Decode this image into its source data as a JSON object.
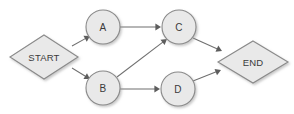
{
  "diagram": {
    "background_color": "#ffffff",
    "node_fill_color": "#e9e9e9",
    "node_stroke_color": "#8a8a8a",
    "edge_color": "#6f6f6f",
    "label_color": "#3a3a3a",
    "nodes": [
      {
        "id": "start",
        "label": "START",
        "shape": "diamond",
        "cx": 44,
        "cy": 57,
        "rx": 34,
        "ry": 22
      },
      {
        "id": "a",
        "label": "A",
        "shape": "circle",
        "cx": 103,
        "cy": 27,
        "r": 17
      },
      {
        "id": "b",
        "label": "B",
        "shape": "circle",
        "cx": 103,
        "cy": 88,
        "r": 17
      },
      {
        "id": "c",
        "label": "C",
        "shape": "circle",
        "cx": 179,
        "cy": 27,
        "r": 17
      },
      {
        "id": "d",
        "label": "D",
        "shape": "circle",
        "cx": 178,
        "cy": 89,
        "r": 17
      },
      {
        "id": "end",
        "label": "END",
        "shape": "diamond",
        "cx": 253,
        "cy": 62,
        "rx": 35,
        "ry": 21
      }
    ],
    "edges": [
      {
        "id": "start-a",
        "from": "START",
        "to": "A",
        "x1": 72,
        "y1": 46,
        "x2": 90,
        "y2": 36
      },
      {
        "id": "start-b",
        "from": "START",
        "to": "B",
        "x1": 72,
        "y1": 68,
        "x2": 90,
        "y2": 79
      },
      {
        "id": "a-c",
        "from": "A",
        "to": "C",
        "x1": 120,
        "y1": 27,
        "x2": 161,
        "y2": 27
      },
      {
        "id": "b-c",
        "from": "B",
        "to": "C",
        "x1": 117,
        "y1": 77,
        "x2": 167,
        "y2": 39
      },
      {
        "id": "b-d",
        "from": "B",
        "to": "D",
        "x1": 120,
        "y1": 89,
        "x2": 160,
        "y2": 89
      },
      {
        "id": "c-end",
        "from": "C",
        "to": "END",
        "x1": 193,
        "y1": 38,
        "x2": 222,
        "y2": 51
      },
      {
        "id": "d-end",
        "from": "D",
        "to": "END",
        "x1": 193,
        "y1": 81,
        "x2": 221,
        "y2": 70
      }
    ]
  }
}
